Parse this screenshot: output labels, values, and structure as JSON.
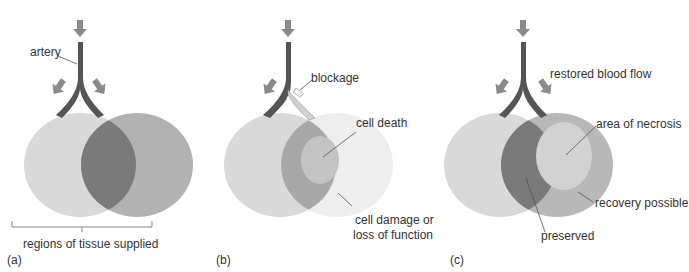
{
  "panels": [
    {
      "id": "a",
      "caption": "(a)",
      "labels": {
        "artery": "artery",
        "regions": "regions of tissue supplied"
      }
    },
    {
      "id": "b",
      "caption": "(b)",
      "labels": {
        "blockage": "blockage",
        "cell_death": "cell death",
        "cell_damage_1": "cell damage or",
        "cell_damage_2": "loss of function"
      }
    },
    {
      "id": "c",
      "caption": "(c)",
      "labels": {
        "restored": "restored blood flow",
        "necrosis": "area of necrosis",
        "recovery": "recovery possible",
        "preserved": "preserved"
      }
    }
  ],
  "colors": {
    "artery": "#555555",
    "arrow": "#8a8a8a",
    "left_region": "#d8d8d8",
    "right_region": "#b4b4b4",
    "overlap": "#7a7a7a",
    "pale_region": "#ececec",
    "blocked_vessel": "#d0d0d0"
  }
}
